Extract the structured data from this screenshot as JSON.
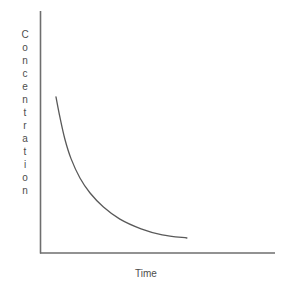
{
  "chart_data": {
    "type": "line",
    "title": "",
    "xlabel": "Time",
    "ylabel": "Concentration",
    "grid": false,
    "legend": null,
    "axis_ticks": {
      "x": [],
      "y": []
    },
    "xlim": [
      0,
      1
    ],
    "ylim": [
      0,
      1
    ],
    "series": [
      {
        "name": "concentration-decay",
        "color": "#595959",
        "points": [
          {
            "x": 0.068,
            "y": 0.645
          },
          {
            "x": 0.085,
            "y": 0.56
          },
          {
            "x": 0.106,
            "y": 0.47
          },
          {
            "x": 0.132,
            "y": 0.39
          },
          {
            "x": 0.17,
            "y": 0.31
          },
          {
            "x": 0.213,
            "y": 0.248
          },
          {
            "x": 0.27,
            "y": 0.19
          },
          {
            "x": 0.34,
            "y": 0.14
          },
          {
            "x": 0.43,
            "y": 0.1
          },
          {
            "x": 0.52,
            "y": 0.075
          },
          {
            "x": 0.625,
            "y": 0.062
          }
        ]
      }
    ]
  },
  "axes": {
    "y_axis_name": "y-axis-line",
    "x_axis_name": "x-axis-line",
    "color": "#6e6e6e"
  },
  "labels": {
    "y_label_text": "Concentration",
    "y_label_letters": [
      "C",
      "o",
      "n",
      "c",
      "e",
      "n",
      "t",
      "r",
      "a",
      "t",
      "i",
      "o",
      "n"
    ],
    "x_label_text": "Time"
  }
}
